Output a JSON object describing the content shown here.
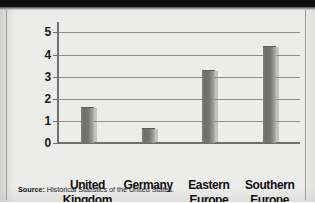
{
  "figure": {
    "source_label": "Source:",
    "source_text": "Historical Statistics of the United States."
  },
  "chart_data": {
    "type": "bar",
    "title": "",
    "xlabel": "",
    "ylabel": "Immigrants (millions)",
    "categories": [
      "United Kingdom",
      "Germany",
      "Eastern Europe",
      "Southern Europe"
    ],
    "category_lines": [
      [
        "United",
        "Kingdom"
      ],
      [
        "Germany",
        ""
      ],
      [
        "Eastern",
        "Europe"
      ],
      [
        "Southern",
        "Europe"
      ]
    ],
    "values": [
      1.6,
      0.65,
      3.25,
      4.35
    ],
    "ylim": [
      0,
      5.2
    ],
    "yticks": [
      0,
      1,
      2,
      3,
      4,
      5
    ],
    "ytick_labels": [
      "0",
      "1",
      "2",
      "3",
      "4",
      "5"
    ],
    "grid": true,
    "legend": false,
    "bar_color": "#75756f",
    "gridline_color": "#8d8d8b",
    "axis_color": "#6f6f6d",
    "text_color": "#100f0f",
    "background_color": "#ececeb"
  }
}
